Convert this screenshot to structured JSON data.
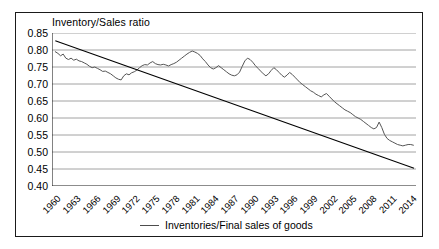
{
  "chart_data": {
    "type": "line",
    "title": "Inventory/Sales ratio",
    "xlabel": "",
    "ylabel": "",
    "ylim": [
      0.4,
      0.85
    ],
    "yticks": [
      "0.40",
      "0.45",
      "0.50",
      "0.55",
      "0.60",
      "0.65",
      "0.70",
      "0.75",
      "0.80",
      "0.85"
    ],
    "ytick_values": [
      0.4,
      0.45,
      0.5,
      0.55,
      0.6,
      0.65,
      0.7,
      0.75,
      0.8,
      0.85
    ],
    "xlim": [
      1959.5,
      2014.8
    ],
    "xticks": [
      "1960",
      "1963",
      "1966",
      "1969",
      "1972",
      "1975",
      "1978",
      "1981",
      "1984",
      "1987",
      "1990",
      "1993",
      "1996",
      "1999",
      "2002",
      "2005",
      "2008",
      "2011",
      "2014"
    ],
    "xtick_values": [
      1960,
      1963,
      1966,
      1969,
      1972,
      1975,
      1978,
      1981,
      1984,
      1987,
      1990,
      1993,
      1996,
      1999,
      2002,
      2005,
      2008,
      2011,
      2014
    ],
    "grid": "horizontal",
    "legend_position": "bottom-center",
    "series": [
      {
        "name": "Inventories/Final sales of goods",
        "color": "#555555",
        "x": [
          1960.0,
          1960.4,
          1960.8,
          1961.2,
          1961.6,
          1962.0,
          1962.4,
          1962.8,
          1963.2,
          1963.6,
          1964.0,
          1964.4,
          1964.8,
          1965.2,
          1965.6,
          1966.0,
          1966.4,
          1966.8,
          1967.2,
          1967.6,
          1968.0,
          1968.4,
          1968.8,
          1969.2,
          1969.6,
          1970.0,
          1970.4,
          1970.8,
          1971.2,
          1971.6,
          1972.0,
          1972.4,
          1972.8,
          1973.2,
          1973.6,
          1974.0,
          1974.4,
          1974.8,
          1975.2,
          1975.6,
          1976.0,
          1976.4,
          1976.8,
          1977.2,
          1977.6,
          1978.0,
          1978.4,
          1978.8,
          1979.2,
          1979.6,
          1980.0,
          1980.4,
          1980.8,
          1981.2,
          1981.6,
          1982.0,
          1982.4,
          1982.8,
          1983.2,
          1983.6,
          1984.0,
          1984.4,
          1984.8,
          1985.2,
          1985.6,
          1986.0,
          1986.4,
          1986.8,
          1987.2,
          1987.6,
          1988.0,
          1988.4,
          1988.8,
          1989.2,
          1989.6,
          1990.0,
          1990.4,
          1990.8,
          1991.2,
          1991.6,
          1992.0,
          1992.4,
          1992.8,
          1993.2,
          1993.6,
          1994.0,
          1994.4,
          1994.8,
          1995.2,
          1995.6,
          1996.0,
          1996.4,
          1996.8,
          1997.2,
          1997.6,
          1998.0,
          1998.4,
          1998.8,
          1999.2,
          1999.6,
          2000.0,
          2000.4,
          2000.8,
          2001.2,
          2001.6,
          2002.0,
          2002.4,
          2002.8,
          2003.2,
          2003.6,
          2004.0,
          2004.4,
          2004.8,
          2005.2,
          2005.6,
          2006.0,
          2006.4,
          2006.8,
          2007.2,
          2007.6,
          2008.0,
          2008.4,
          2008.8,
          2009.2,
          2009.6,
          2010.0,
          2010.4,
          2010.8,
          2011.2,
          2011.6,
          2012.0,
          2012.4,
          2012.8,
          2013.2,
          2013.6,
          2014.0,
          2014.4
        ],
        "values": [
          0.795,
          0.79,
          0.783,
          0.788,
          0.776,
          0.772,
          0.776,
          0.77,
          0.773,
          0.768,
          0.766,
          0.762,
          0.758,
          0.752,
          0.748,
          0.75,
          0.746,
          0.742,
          0.737,
          0.738,
          0.734,
          0.73,
          0.724,
          0.718,
          0.714,
          0.712,
          0.724,
          0.73,
          0.727,
          0.733,
          0.736,
          0.741,
          0.748,
          0.754,
          0.757,
          0.756,
          0.762,
          0.766,
          0.76,
          0.757,
          0.756,
          0.758,
          0.756,
          0.753,
          0.757,
          0.76,
          0.764,
          0.77,
          0.776,
          0.782,
          0.788,
          0.793,
          0.797,
          0.794,
          0.79,
          0.784,
          0.774,
          0.766,
          0.756,
          0.748,
          0.744,
          0.748,
          0.754,
          0.748,
          0.742,
          0.736,
          0.73,
          0.726,
          0.724,
          0.727,
          0.735,
          0.752,
          0.768,
          0.776,
          0.772,
          0.764,
          0.754,
          0.746,
          0.738,
          0.73,
          0.724,
          0.73,
          0.74,
          0.748,
          0.742,
          0.734,
          0.726,
          0.72,
          0.726,
          0.734,
          0.728,
          0.72,
          0.712,
          0.704,
          0.698,
          0.692,
          0.686,
          0.68,
          0.676,
          0.67,
          0.666,
          0.662,
          0.668,
          0.672,
          0.664,
          0.656,
          0.648,
          0.642,
          0.636,
          0.63,
          0.624,
          0.62,
          0.616,
          0.61,
          0.604,
          0.6,
          0.596,
          0.59,
          0.584,
          0.578,
          0.572,
          0.568,
          0.572,
          0.588,
          0.572,
          0.552,
          0.54,
          0.534,
          0.53,
          0.526,
          0.522,
          0.52,
          0.518,
          0.52,
          0.522,
          0.522,
          0.52
        ],
        "display_range": "1960-2014",
        "approx_start_value": 0.795,
        "approx_end_value": 0.52
      },
      {
        "name": "trend",
        "color": "#000000",
        "type": "trendline",
        "start": {
          "x": 1960,
          "y": 0.827
        },
        "end": {
          "x": 2014.5,
          "y": 0.452
        }
      }
    ],
    "legend": [
      {
        "label": "Inventories/Final sales of goods",
        "marker": "line",
        "color": "#4d4d4d"
      }
    ]
  },
  "legend": {
    "label": "Inventories/Final sales of goods"
  },
  "title": {
    "text": "Inventory/Sales ratio"
  }
}
